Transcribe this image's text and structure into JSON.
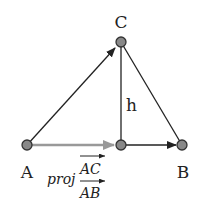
{
  "diagram": {
    "points": {
      "A": {
        "label": "A",
        "x": 27,
        "y": 145
      },
      "B": {
        "label": "B",
        "x": 182,
        "y": 145
      },
      "C": {
        "label": "C",
        "x": 121,
        "y": 42
      },
      "P": {
        "label": "",
        "x": 121,
        "y": 145
      }
    },
    "height_label": "h",
    "projection_label": {
      "prefix": "proj",
      "numerator": "AC",
      "denominator": "AB"
    },
    "colors": {
      "line": "#222222",
      "projection_arrow": "#999999",
      "point_fill": "#888888",
      "point_stroke": "#333333"
    }
  }
}
